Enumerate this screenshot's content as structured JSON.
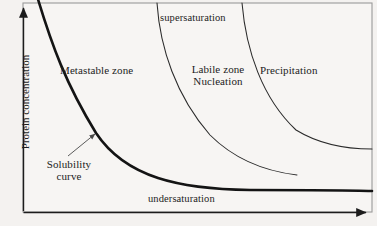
{
  "figure": {
    "background_color": "#f4f2f0",
    "frame_color": "#8a8a8a",
    "axis_color": "#1c1c1c",
    "curve_color": "#1c1c1c",
    "solubility_curve_color": "#111111",
    "width": 377,
    "height": 226
  },
  "axes": {
    "y_title": "Protein concentration",
    "x_title": "",
    "y_arrow": "up-arrow-icon",
    "x_arrow": "right-arrow-icon"
  },
  "zones": [
    {
      "id": "supersaturation",
      "label": "supersaturation"
    },
    {
      "id": "metastable",
      "label": "Metastable zone"
    },
    {
      "id": "labile",
      "label_line1": "Labile zone",
      "label_line2": "Nucleation"
    },
    {
      "id": "precipitation",
      "label": "Precipitation"
    },
    {
      "id": "undersaturation",
      "label": "undersaturation"
    }
  ],
  "annotation": {
    "label_line1": "Solubility",
    "label_line2": "curve",
    "pointer": "leader-arrow-icon"
  },
  "chart_data": {
    "type": "line",
    "title": "",
    "xlabel": "",
    "ylabel": "Protein concentration",
    "xlim": [
      0,
      377
    ],
    "ylim": [
      0,
      226
    ],
    "grid": false,
    "legend": null,
    "annotations": [
      {
        "text": "supersaturation",
        "x": 160,
        "y": 12
      },
      {
        "text": "Metastable zone",
        "x": 60,
        "y": 64
      },
      {
        "text": "Labile zone",
        "x": 178,
        "y": 63
      },
      {
        "text": "Nucleation",
        "x": 178,
        "y": 76
      },
      {
        "text": "Precipitation",
        "x": 260,
        "y": 64
      },
      {
        "text": "undersaturation",
        "x": 148,
        "y": 193
      },
      {
        "text": "Solubility curve",
        "x": 38,
        "y": 158,
        "arrow_to": [
          96,
          133
        ]
      }
    ],
    "series": [
      {
        "name": "Solubility curve",
        "style": "thick",
        "path": "M 37,-4 C 52,46 66,84 96,133 C 126,178 180,189 250,190 C 300,190 345,190 372,191"
      },
      {
        "name": "Nucleation boundary",
        "style": "thin",
        "path": "M 157,3 C 160,48 176,96 210,135 C 238,163 272,172 297,175"
      },
      {
        "name": "Precipitation boundary",
        "style": "thin",
        "path": "M 242,3 C 246,50 262,98 296,130 C 322,146 352,149 372,149"
      }
    ],
    "frame": {
      "x0": 23,
      "y0": 3,
      "x1": 372,
      "y1": 212
    }
  }
}
